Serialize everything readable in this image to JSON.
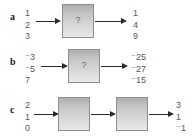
{
  "figure": {
    "type": "function-machine-diagram",
    "background_color": "#ffffff",
    "number_color": "#5a5a5a",
    "label_color": "#1b1b1b",
    "arrow_color": "#2a2a2a",
    "box_border_color": "#8e8e8e"
  },
  "rows": [
    {
      "label": "a",
      "inputs": [
        "1",
        "2",
        "3"
      ],
      "machines": [
        {
          "text": "?"
        }
      ],
      "outputs": [
        "1",
        "4",
        "9"
      ]
    },
    {
      "label": "b",
      "inputs": [
        "⁻3",
        "⁻5",
        "7"
      ],
      "machines": [
        {
          "text": "?"
        }
      ],
      "outputs": [
        "⁻25",
        "⁻27",
        "⁻15"
      ]
    },
    {
      "label": "c",
      "inputs": [
        "2",
        "1",
        "0"
      ],
      "machines": [
        {
          "text": ""
        },
        {
          "text": ""
        }
      ],
      "outputs": [
        "3",
        "1",
        "⁻1"
      ]
    }
  ]
}
